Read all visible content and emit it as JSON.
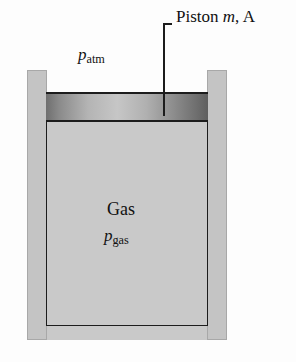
{
  "figure": {
    "background_color": "#fdfdfd",
    "labels": {
      "piston": {
        "text": "Piston",
        "symbol_mass": "m",
        "separator": ", ",
        "symbol_area": "A",
        "full_text": "Piston m, A"
      },
      "atmospheric_pressure": {
        "symbol": "p",
        "subscript": "atm",
        "full_text": "patm"
      },
      "gas": {
        "text": "Gas"
      },
      "gas_pressure": {
        "symbol": "p",
        "subscript": "gas",
        "full_text": "pgas"
      }
    },
    "colors": {
      "backing_block": "#c9c9c9",
      "wall_fill": "#c4c4c4",
      "wall_border": "#a8a8a8",
      "gas_fill": "#c9c9c9",
      "outline": "#1c1c1c",
      "piston_dark": "#6a6a6a",
      "piston_light": "#c6c6c6",
      "text": "#111111"
    },
    "parts": {
      "backing_block": "backing-block",
      "left_wall": "cylinder-wall-left",
      "right_wall": "cylinder-wall-right",
      "gas_chamber": "gas-chamber",
      "piston": "piston-band",
      "leader_line": "piston-leader-line"
    }
  }
}
